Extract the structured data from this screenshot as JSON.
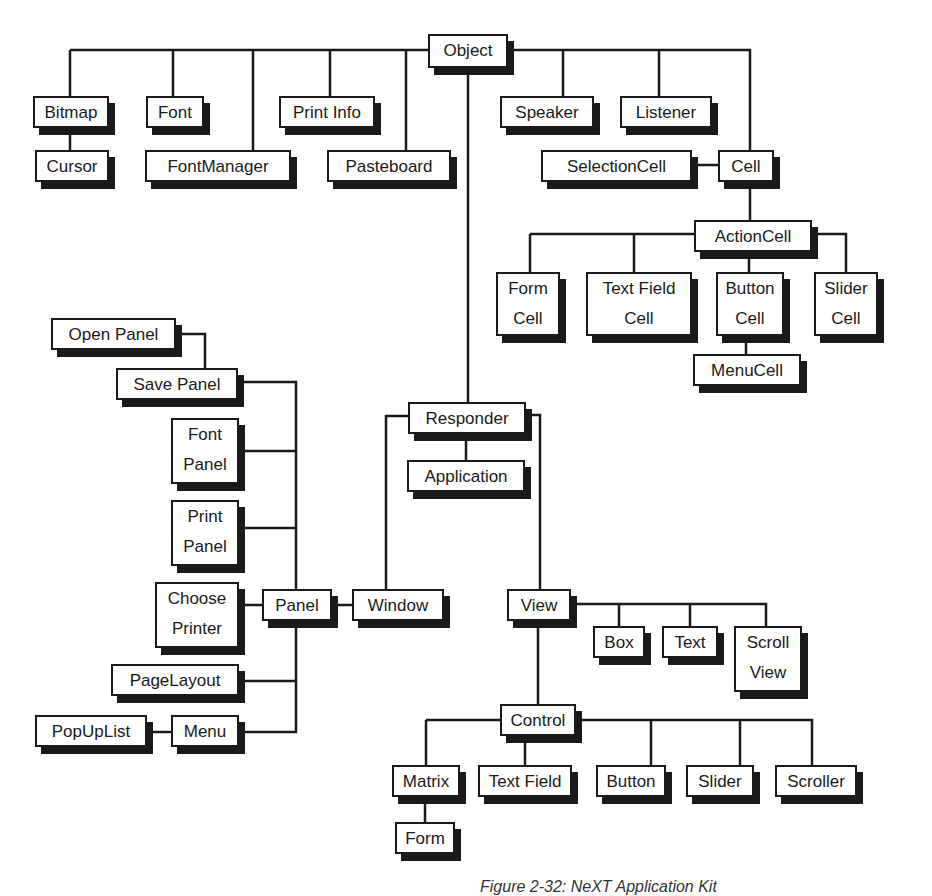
{
  "diagram": {
    "caption": "Figure 2-32: NeXT Application Kit",
    "nodes": {
      "object": "Object",
      "bitmap": "Bitmap",
      "cursor": "Cursor",
      "font": "Font",
      "fontmanager": "FontManager",
      "printinfo": "Print Info",
      "pasteboard": "Pasteboard",
      "speaker": "Speaker",
      "listener": "Listener",
      "selectioncell": "SelectionCell",
      "cell": "Cell",
      "actioncell": "ActionCell",
      "formcell_1": "Form",
      "formcell_2": "Cell",
      "textfieldcell_1": "Text Field",
      "textfieldcell_2": "Cell",
      "buttoncell_1": "Button",
      "buttoncell_2": "Cell",
      "slidercell_1": "Slider",
      "slidercell_2": "Cell",
      "menucell": "MenuCell",
      "openpanel": "Open Panel",
      "savepanel": "Save Panel",
      "fontpanel_1": "Font",
      "fontpanel_2": "Panel",
      "printpanel_1": "Print",
      "printpanel_2": "Panel",
      "chooseprinter_1": "Choose",
      "chooseprinter_2": "Printer",
      "panel": "Panel",
      "window": "Window",
      "pagelayout": "PageLayout",
      "popuplist": "PopUpList",
      "menu": "Menu",
      "responder": "Responder",
      "application": "Application",
      "view": "View",
      "box": "Box",
      "text": "Text",
      "scrollview_1": "Scroll",
      "scrollview_2": "View",
      "control": "Control",
      "matrix": "Matrix",
      "form": "Form",
      "textfield": "Text Field",
      "button": "Button",
      "slider": "Slider",
      "scroller": "Scroller"
    },
    "edges": [
      [
        "Object",
        "Bitmap"
      ],
      [
        "Object",
        "Font"
      ],
      [
        "Object",
        "FontManager"
      ],
      [
        "Object",
        "Print Info"
      ],
      [
        "Object",
        "Pasteboard"
      ],
      [
        "Object",
        "Speaker"
      ],
      [
        "Object",
        "Listener"
      ],
      [
        "Object",
        "Cell"
      ],
      [
        "Object",
        "Responder"
      ],
      [
        "Bitmap",
        "Cursor"
      ],
      [
        "Cell",
        "SelectionCell"
      ],
      [
        "Cell",
        "ActionCell"
      ],
      [
        "ActionCell",
        "Form Cell"
      ],
      [
        "ActionCell",
        "Text Field Cell"
      ],
      [
        "ActionCell",
        "Button Cell"
      ],
      [
        "ActionCell",
        "Slider Cell"
      ],
      [
        "Button Cell",
        "MenuCell"
      ],
      [
        "Responder",
        "Application"
      ],
      [
        "Responder",
        "Window"
      ],
      [
        "Responder",
        "View"
      ],
      [
        "Window",
        "Panel"
      ],
      [
        "Panel",
        "Save Panel"
      ],
      [
        "Save Panel",
        "Open Panel"
      ],
      [
        "Panel",
        "Font Panel"
      ],
      [
        "Panel",
        "Print Panel"
      ],
      [
        "Panel",
        "Choose Printer"
      ],
      [
        "Panel",
        "PageLayout"
      ],
      [
        "Panel",
        "Menu"
      ],
      [
        "Menu",
        "PopUpList"
      ],
      [
        "View",
        "Box"
      ],
      [
        "View",
        "Text"
      ],
      [
        "View",
        "Scroll View"
      ],
      [
        "View",
        "Control"
      ],
      [
        "Control",
        "Matrix"
      ],
      [
        "Control",
        "Text Field"
      ],
      [
        "Control",
        "Button"
      ],
      [
        "Control",
        "Slider"
      ],
      [
        "Control",
        "Scroller"
      ],
      [
        "Matrix",
        "Form"
      ]
    ]
  }
}
